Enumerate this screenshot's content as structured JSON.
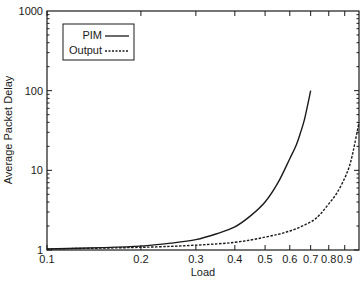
{
  "chart_data": {
    "type": "line",
    "title": "",
    "xlabel": "Load",
    "ylabel": "Average Packet Delay",
    "xscale": "log",
    "yscale": "log",
    "xlim": [
      0.1,
      1.0
    ],
    "ylim": [
      1,
      1000
    ],
    "grid": false,
    "legend_position": "upper left",
    "x_ticks": [
      {
        "value": 0.1,
        "label": "0.1"
      },
      {
        "value": 0.2,
        "label": "0.2"
      },
      {
        "value": 0.3,
        "label": "0.3"
      },
      {
        "value": 0.4,
        "label": "0.4"
      },
      {
        "value": 0.5,
        "label": "0.5"
      },
      {
        "value": 0.6,
        "label": "0.6"
      },
      {
        "value": 0.7,
        "label": "0.7"
      },
      {
        "value": 0.8,
        "label": "0.8"
      },
      {
        "value": 0.9,
        "label": "0.9"
      }
    ],
    "y_ticks": [
      {
        "value": 1,
        "label": "1"
      },
      {
        "value": 10,
        "label": "10"
      },
      {
        "value": 100,
        "label": "100"
      },
      {
        "value": 1000,
        "label": "1000"
      }
    ],
    "series": [
      {
        "name": "PIM",
        "style": "solid",
        "color": "#1a1a1a",
        "x": [
          0.1,
          0.15,
          0.2,
          0.25,
          0.3,
          0.35,
          0.4,
          0.45,
          0.5,
          0.55,
          0.6,
          0.63,
          0.65,
          0.67,
          0.7
        ],
        "y": [
          1.03,
          1.07,
          1.12,
          1.22,
          1.35,
          1.6,
          1.95,
          2.7,
          4.0,
          7.0,
          14,
          21,
          30,
          45,
          100
        ]
      },
      {
        "name": "Output",
        "style": "dashed",
        "color": "#1a1a1a",
        "x": [
          0.1,
          0.2,
          0.3,
          0.4,
          0.5,
          0.6,
          0.7,
          0.75,
          0.8,
          0.85,
          0.9,
          0.93,
          0.95,
          0.97,
          1.0
        ],
        "y": [
          1.03,
          1.08,
          1.15,
          1.25,
          1.45,
          1.73,
          2.25,
          2.8,
          3.8,
          5.2,
          8.0,
          11,
          15,
          22,
          40
        ]
      }
    ]
  },
  "legend": {
    "items": [
      {
        "label": "PIM",
        "style": "solid"
      },
      {
        "label": "Output",
        "style": "dashed"
      }
    ]
  }
}
